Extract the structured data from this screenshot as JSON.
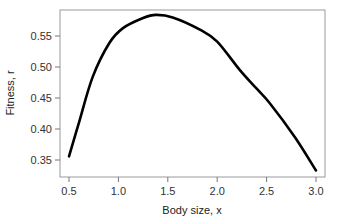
{
  "chart_data": {
    "type": "line",
    "title": "",
    "xlabel": "Body size, x",
    "ylabel": "Fitness, r",
    "xlim": [
      0.45,
      3.05
    ],
    "ylim": [
      0.322,
      0.592
    ],
    "xticks": [
      0.5,
      1.0,
      1.5,
      2.0,
      2.5,
      3.0
    ],
    "xtick_labels": [
      "0.5",
      "1.0",
      "1.5",
      "2.0",
      "2.5",
      "3.0"
    ],
    "yticks": [
      0.35,
      0.4,
      0.45,
      0.5,
      0.55
    ],
    "ytick_labels": [
      "0.35",
      "0.40",
      "0.45",
      "0.50",
      "0.55"
    ],
    "grid": false,
    "legend": null,
    "series": [
      {
        "name": "fitness",
        "color": "#000000",
        "x": [
          0.5,
          0.6,
          0.74,
          0.91,
          1.05,
          1.25,
          1.38,
          1.55,
          1.83,
          2.0,
          2.23,
          2.4,
          2.53,
          2.79,
          3.0
        ],
        "y": [
          0.356,
          0.41,
          0.484,
          0.539,
          0.563,
          0.579,
          0.584,
          0.58,
          0.56,
          0.541,
          0.495,
          0.465,
          0.442,
          0.386,
          0.333
        ]
      }
    ]
  }
}
